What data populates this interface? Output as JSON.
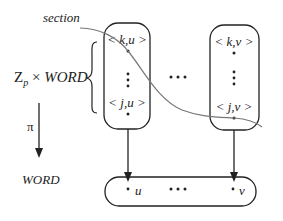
{
  "diagram": {
    "section_label": "section",
    "total_space": {
      "base": "Z",
      "subscript": "p",
      "times": "×",
      "word": "WORD"
    },
    "projection_label": "π",
    "base_space_label": "WORD",
    "fiber_u": {
      "top": "< k,u >",
      "bottom": "< j,u >"
    },
    "fiber_v": {
      "top": "< k,v >",
      "bottom": "< j,v >"
    },
    "fiber_ellipsis": "• • •",
    "base_points": {
      "left": "u",
      "right": "v",
      "ellipsis": "• • •"
    },
    "colors": {
      "ink": "#222222",
      "section_curve": "#777777"
    }
  }
}
